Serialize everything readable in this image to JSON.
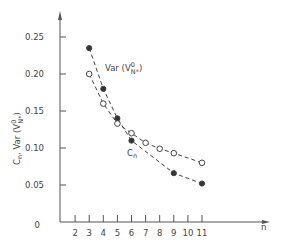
{
  "chart_data": {
    "type": "line",
    "title": "",
    "xlabel": "n",
    "ylabel": "Cn, Var(V⁰N*)",
    "xlim": [
      1,
      19
    ],
    "ylim": [
      0,
      0.27
    ],
    "x_ticks": [
      2,
      3,
      4,
      5,
      6,
      7,
      8,
      9,
      10,
      11
    ],
    "x_tick_labels": [
      "2",
      "3",
      "4",
      "5",
      "6",
      "7",
      "8",
      "9",
      "10",
      "11"
    ],
    "y_ticks": [
      0,
      0.05,
      0.1,
      0.15,
      0.2,
      0.25
    ],
    "y_tick_labels": [
      "0",
      "0.05",
      "0.10",
      "0.15",
      "0.20",
      "0.25"
    ],
    "grid": false,
    "legend": "inline labels",
    "series": [
      {
        "name": "Var(V⁰N*)",
        "marker": "filled-circle",
        "line": "dashed",
        "x": [
          3,
          4,
          5,
          6,
          9,
          11
        ],
        "values": [
          0.235,
          0.18,
          0.14,
          0.11,
          0.066,
          0.052
        ]
      },
      {
        "name": "Cn",
        "marker": "open-circle",
        "line": "dashed",
        "x": [
          3,
          4,
          5,
          6,
          7,
          8,
          9,
          11
        ],
        "values": [
          0.2,
          0.16,
          0.133,
          0.12,
          0.107,
          0.099,
          0.093,
          0.08
        ]
      }
    ],
    "annotations": [
      {
        "text_main": "Var (V",
        "sup": "0",
        "sub": "N*",
        "close": ")",
        "near_series": "Var(V⁰N*)"
      },
      {
        "text_main": "C",
        "sub": "n",
        "near_series": "Cn"
      }
    ]
  },
  "labels": {
    "y_axis_main": "C",
    "y_axis_sub_n": "n",
    "y_axis_rest": ", Var (V",
    "y_axis_sup": "0",
    "y_axis_sub": "N*",
    "y_axis_close": ")",
    "x_axis": "n",
    "var_main": "Var (V",
    "var_sup": "0",
    "var_sub": "N*",
    "var_close": ")",
    "cn_main": "C",
    "cn_sub": "n"
  }
}
